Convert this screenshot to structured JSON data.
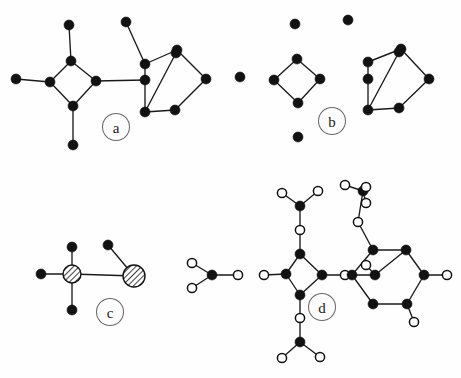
{
  "figure": {
    "background_color": "#fefefe",
    "node_fill_color": "#121212",
    "node_open_color": "#ffffff",
    "edge_color": "#1a1a1a",
    "label_circle_color": "#6a6a6a",
    "width": 461,
    "height": 378
  },
  "panels": [
    {
      "id": "a",
      "label": "a",
      "label_pos": {
        "x": 116,
        "y": 127
      },
      "description": "Connected graph: diamond (4-cycle) with three pendant vertices joined by a bridge to a hexagon with one interior vertex",
      "nodes": [
        {
          "id": "a1",
          "x": 69,
          "y": 25,
          "type": "filled"
        },
        {
          "id": "a2",
          "x": 71,
          "y": 61,
          "type": "filled"
        },
        {
          "id": "a3",
          "x": 16,
          "y": 79,
          "type": "filled"
        },
        {
          "id": "a4",
          "x": 50,
          "y": 82,
          "type": "filled"
        },
        {
          "id": "a5",
          "x": 96,
          "y": 81,
          "type": "filled"
        },
        {
          "id": "a6",
          "x": 73,
          "y": 106,
          "type": "filled"
        },
        {
          "id": "a7",
          "x": 73,
          "y": 145,
          "type": "filled"
        },
        {
          "id": "a8",
          "x": 126,
          "y": 22,
          "type": "filled"
        },
        {
          "id": "a9",
          "x": 145,
          "y": 64,
          "type": "filled"
        },
        {
          "id": "a10",
          "x": 145,
          "y": 80,
          "type": "filled"
        },
        {
          "id": "a11",
          "x": 177,
          "y": 50,
          "type": "filled"
        },
        {
          "id": "a12",
          "x": 176,
          "y": 53,
          "type": "filled"
        },
        {
          "id": "a13",
          "x": 206,
          "y": 79,
          "type": "filled"
        },
        {
          "id": "a14",
          "x": 175,
          "y": 110,
          "type": "filled"
        },
        {
          "id": "a15",
          "x": 145,
          "y": 112,
          "type": "filled"
        }
      ],
      "edges": [
        [
          "a1",
          "a2"
        ],
        [
          "a2",
          "a4"
        ],
        [
          "a2",
          "a5"
        ],
        [
          "a3",
          "a4"
        ],
        [
          "a4",
          "a6"
        ],
        [
          "a5",
          "a6"
        ],
        [
          "a6",
          "a7"
        ],
        [
          "a5",
          "a10"
        ],
        [
          "a8",
          "a9"
        ],
        [
          "a9",
          "a11"
        ],
        [
          "a9",
          "a10"
        ],
        [
          "a10",
          "a15"
        ],
        [
          "a11",
          "a13"
        ],
        [
          "a13",
          "a14"
        ],
        [
          "a14",
          "a15"
        ],
        [
          "a11",
          "a12"
        ],
        [
          "a12",
          "a15"
        ]
      ]
    },
    {
      "id": "b",
      "label": "b",
      "label_pos": {
        "x": 332,
        "y": 121
      },
      "description": "Same vertex set as panel a with all bridges removed: three isolated vertices, an isolated diamond, a dangling vertex, and a hexagon with interior vertex",
      "nodes": [
        {
          "id": "b1",
          "x": 295,
          "y": 24,
          "type": "filled"
        },
        {
          "id": "b2",
          "x": 297,
          "y": 59,
          "type": "filled"
        },
        {
          "id": "b3",
          "x": 240,
          "y": 77,
          "type": "filled"
        },
        {
          "id": "b4",
          "x": 274,
          "y": 80,
          "type": "filled"
        },
        {
          "id": "b5",
          "x": 320,
          "y": 79,
          "type": "filled"
        },
        {
          "id": "b6",
          "x": 298,
          "y": 103,
          "type": "filled"
        },
        {
          "id": "b7",
          "x": 298,
          "y": 137,
          "type": "filled"
        },
        {
          "id": "b8",
          "x": 348,
          "y": 20,
          "type": "filled"
        },
        {
          "id": "b9",
          "x": 368,
          "y": 62,
          "type": "filled"
        },
        {
          "id": "b10",
          "x": 368,
          "y": 79,
          "type": "filled"
        },
        {
          "id": "b11",
          "x": 401,
          "y": 49,
          "type": "filled"
        },
        {
          "id": "b12",
          "x": 399,
          "y": 52,
          "type": "filled"
        },
        {
          "id": "b13",
          "x": 429,
          "y": 79,
          "type": "filled"
        },
        {
          "id": "b14",
          "x": 399,
          "y": 108,
          "type": "filled"
        },
        {
          "id": "b15",
          "x": 368,
          "y": 110,
          "type": "filled"
        }
      ],
      "edges": [
        [
          "b2",
          "b4"
        ],
        [
          "b2",
          "b5"
        ],
        [
          "b4",
          "b6"
        ],
        [
          "b5",
          "b6"
        ],
        [
          "b9",
          "b11"
        ],
        [
          "b9",
          "b10"
        ],
        [
          "b10",
          "b15"
        ],
        [
          "b11",
          "b13"
        ],
        [
          "b13",
          "b14"
        ],
        [
          "b14",
          "b15"
        ],
        [
          "b11",
          "b12"
        ],
        [
          "b12",
          "b15"
        ]
      ]
    },
    {
      "id": "c",
      "label": "c",
      "label_pos": {
        "x": 110,
        "y": 312
      },
      "description": "Condensed block-cut tree: two hatched circles represent the contracted diamond and hexagon blocks, with filled pendant vertices attached",
      "nodes": [
        {
          "id": "c1",
          "x": 72,
          "y": 247,
          "type": "filled"
        },
        {
          "id": "c2",
          "x": 72,
          "y": 274,
          "type": "hatched",
          "r": 9
        },
        {
          "id": "c3",
          "x": 41,
          "y": 274,
          "type": "filled"
        },
        {
          "id": "c4",
          "x": 72,
          "y": 310,
          "type": "filled"
        },
        {
          "id": "c5",
          "x": 108,
          "y": 245,
          "type": "filled"
        },
        {
          "id": "c6",
          "x": 134,
          "y": 276,
          "type": "hatched",
          "r": 11
        }
      ],
      "edges": [
        [
          "c1",
          "c2"
        ],
        [
          "c3",
          "c2"
        ],
        [
          "c2",
          "c4"
        ],
        [
          "c2",
          "c6"
        ],
        [
          "c5",
          "c6"
        ]
      ]
    },
    {
      "id": "d",
      "label": "d",
      "label_pos": {
        "x": 322,
        "y": 307
      },
      "description": "Molecular-style rendering: filled circles are heavy atoms, open circles are terminal substituents; methyl-like groups decorate a diamond ring and a hexagonal ring with an interior atom",
      "nodes": [
        {
          "id": "d1",
          "x": 192,
          "y": 263,
          "type": "open"
        },
        {
          "id": "d2",
          "x": 192,
          "y": 288,
          "type": "open"
        },
        {
          "id": "d3",
          "x": 212,
          "y": 275,
          "type": "filled"
        },
        {
          "id": "d4",
          "x": 238,
          "y": 275,
          "type": "open"
        },
        {
          "id": "d5",
          "x": 264,
          "y": 275,
          "type": "open"
        },
        {
          "id": "d6",
          "x": 286,
          "y": 274,
          "type": "filled"
        },
        {
          "id": "d7",
          "x": 300,
          "y": 254,
          "type": "filled"
        },
        {
          "id": "d8",
          "x": 300,
          "y": 230,
          "type": "open"
        },
        {
          "id": "d9",
          "x": 300,
          "y": 206,
          "type": "filled"
        },
        {
          "id": "d10",
          "x": 282,
          "y": 193,
          "type": "open"
        },
        {
          "id": "d11",
          "x": 318,
          "y": 191,
          "type": "open"
        },
        {
          "id": "d12",
          "x": 322,
          "y": 275,
          "type": "filled"
        },
        {
          "id": "d13",
          "x": 345,
          "y": 275,
          "type": "open"
        },
        {
          "id": "d14",
          "x": 300,
          "y": 295,
          "type": "filled"
        },
        {
          "id": "d15",
          "x": 300,
          "y": 318,
          "type": "open"
        },
        {
          "id": "d16",
          "x": 300,
          "y": 342,
          "type": "filled"
        },
        {
          "id": "d17",
          "x": 282,
          "y": 358,
          "type": "open"
        },
        {
          "id": "d18",
          "x": 320,
          "y": 357,
          "type": "open"
        },
        {
          "id": "d19",
          "x": 363,
          "y": 191,
          "type": "filled"
        },
        {
          "id": "d20",
          "x": 345,
          "y": 185,
          "type": "open"
        },
        {
          "id": "d21",
          "x": 366,
          "y": 203,
          "type": "open"
        },
        {
          "id": "d22",
          "x": 366,
          "y": 187,
          "type": "open"
        },
        {
          "id": "d23",
          "x": 358,
          "y": 222,
          "type": "open"
        },
        {
          "id": "d24",
          "x": 373,
          "y": 250,
          "type": "filled"
        },
        {
          "id": "d25",
          "x": 406,
          "y": 250,
          "type": "filled"
        },
        {
          "id": "d26",
          "x": 352,
          "y": 275,
          "type": "filled"
        },
        {
          "id": "d27",
          "x": 375,
          "y": 275,
          "type": "filled"
        },
        {
          "id": "d28",
          "x": 366,
          "y": 265,
          "type": "open"
        },
        {
          "id": "d29",
          "x": 424,
          "y": 275,
          "type": "filled"
        },
        {
          "id": "d30",
          "x": 447,
          "y": 275,
          "type": "open"
        },
        {
          "id": "d31",
          "x": 373,
          "y": 304,
          "type": "filled"
        },
        {
          "id": "d32",
          "x": 407,
          "y": 304,
          "type": "filled"
        },
        {
          "id": "d33",
          "x": 414,
          "y": 322,
          "type": "open"
        }
      ],
      "edges": [
        [
          "d1",
          "d3"
        ],
        [
          "d2",
          "d3"
        ],
        [
          "d3",
          "d4"
        ],
        [
          "d5",
          "d6"
        ],
        [
          "d6",
          "d7"
        ],
        [
          "d7",
          "d8"
        ],
        [
          "d8",
          "d9"
        ],
        [
          "d9",
          "d10"
        ],
        [
          "d9",
          "d11"
        ],
        [
          "d6",
          "d14"
        ],
        [
          "d7",
          "d12"
        ],
        [
          "d12",
          "d14"
        ],
        [
          "d12",
          "d13"
        ],
        [
          "d14",
          "d15"
        ],
        [
          "d15",
          "d16"
        ],
        [
          "d16",
          "d17"
        ],
        [
          "d16",
          "d18"
        ],
        [
          "d19",
          "d20"
        ],
        [
          "d19",
          "d21"
        ],
        [
          "d19",
          "d22"
        ],
        [
          "d19",
          "d23"
        ],
        [
          "d23",
          "d24"
        ],
        [
          "d24",
          "d25"
        ],
        [
          "d24",
          "d26"
        ],
        [
          "d26",
          "d27"
        ],
        [
          "d27",
          "d28"
        ],
        [
          "d25",
          "d29"
        ],
        [
          "d29",
          "d30"
        ],
        [
          "d26",
          "d31"
        ],
        [
          "d31",
          "d32"
        ],
        [
          "d32",
          "d29"
        ],
        [
          "d27",
          "d25"
        ],
        [
          "d32",
          "d33"
        ]
      ]
    }
  ]
}
